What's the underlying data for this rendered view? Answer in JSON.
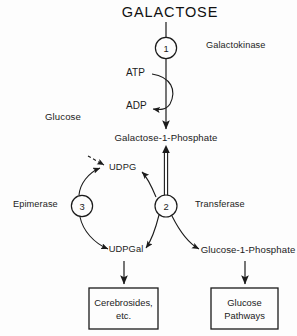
{
  "diagram": {
    "title": "GALACTOSE",
    "type": "galactose-metabolism-pathway",
    "background_color": "#fdfdfd",
    "stroke_color": "#1b1b1b"
  },
  "metabolites": {
    "galactose": "GALACTOSE",
    "galactose_1_phosphate": "Galactose-1-Phosphate",
    "udpg": "UDPG",
    "udpgal": "UDPGal",
    "glucose_1_phosphate": "Glucose-1-Phosphate",
    "glucose": "Glucose"
  },
  "cofactors": {
    "atp": "ATP",
    "adp": "ADP"
  },
  "enzymes": [
    {
      "step": "1",
      "name": "Galactokinase"
    },
    {
      "step": "2",
      "name": "Transferase"
    },
    {
      "step": "3",
      "name": "Epimerase"
    }
  ],
  "enzyme_nodes": {
    "one": "1",
    "two": "2",
    "three": "3"
  },
  "enzyme_labels": {
    "galactokinase": "Galactokinase",
    "transferase": "Transferase",
    "epimerase": "Epimerase"
  },
  "outcome_boxes": [
    {
      "line1": "Cerebrosides,",
      "line2": "etc."
    },
    {
      "line1": "Glucose",
      "line2": "Pathways"
    }
  ],
  "boxes": {
    "cerebrosides": {
      "line1": "Cerebrosides,",
      "line2": "etc."
    },
    "glucose_pathways": {
      "line1": "Glucose",
      "line2": "Pathways"
    }
  }
}
